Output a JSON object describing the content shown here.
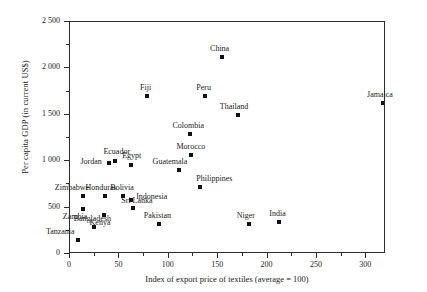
{
  "chart_data": {
    "type": "scatter",
    "title": "",
    "xlabel": "Index of export price of textiles (average = 100)",
    "ylabel": "Per capita GDP (in current US$)",
    "xlim": [
      0,
      320
    ],
    "ylim": [
      0,
      2500
    ],
    "grid": false,
    "legend": "none",
    "xticks": [
      0,
      50,
      100,
      150,
      200,
      250,
      300
    ],
    "xtick_labels": [
      "0",
      "50",
      "100",
      "150",
      "200",
      "250",
      "300"
    ],
    "xticks_minor": [
      25,
      75,
      125,
      175,
      225,
      275
    ],
    "yticks": [
      0,
      500,
      1000,
      1500,
      2000,
      2500
    ],
    "ytick_labels": [
      "0",
      "500",
      "1 000",
      "1 500",
      "2 000",
      "2 500"
    ],
    "yticks_minor": [
      250,
      750,
      1250,
      1750,
      2250
    ],
    "marker": "square",
    "marker_color": "#111111",
    "points": [
      {
        "name": "Tanzania",
        "x": 9,
        "y": 140,
        "lx": -32,
        "ly": -12
      },
      {
        "name": "Bangladesh",
        "x": 25,
        "y": 280,
        "lx": -20,
        "ly": -12
      },
      {
        "name": "Zambia",
        "x": 14,
        "y": 475,
        "lx": -20,
        "ly": 4
      },
      {
        "name": "Zimbabwe",
        "x": 14,
        "y": 615,
        "lx": -28,
        "ly": -12
      },
      {
        "name": "Kenya",
        "x": 35,
        "y": 410,
        "lx": -14,
        "ly": 4
      },
      {
        "name": "Honduras",
        "x": 36,
        "y": 615,
        "lx": -19,
        "ly": -12
      },
      {
        "name": "Bolivia",
        "x": 55,
        "y": 615,
        "lx": -13,
        "ly": -12
      },
      {
        "name": "Indonesia",
        "x": 63,
        "y": 570,
        "lx": 5,
        "ly": -7
      },
      {
        "name": "Sri Lanka",
        "x": 65,
        "y": 485,
        "lx": -12,
        "ly": -11
      },
      {
        "name": "Jordan",
        "x": 40,
        "y": 970,
        "lx": -28,
        "ly": -5
      },
      {
        "name": "Ecuador",
        "x": 47,
        "y": 990,
        "lx": -12,
        "ly": -13
      },
      {
        "name": "Egypt",
        "x": 63,
        "y": 950,
        "lx": -9,
        "ly": -13
      },
      {
        "name": "Pakistan",
        "x": 91,
        "y": 310,
        "lx": -15,
        "ly": -12
      },
      {
        "name": "Philippines",
        "x": 133,
        "y": 710,
        "lx": -4,
        "ly": -12
      },
      {
        "name": "Guatemala",
        "x": 111,
        "y": 895,
        "lx": -26,
        "ly": -12
      },
      {
        "name": "Morocco",
        "x": 124,
        "y": 1055,
        "lx": -15,
        "ly": -12
      },
      {
        "name": "Colombia",
        "x": 123,
        "y": 1280,
        "lx": -18,
        "ly": -12
      },
      {
        "name": "Thailand",
        "x": 171,
        "y": 1485,
        "lx": -18,
        "ly": -12
      },
      {
        "name": "Peru",
        "x": 138,
        "y": 1690,
        "lx": -9,
        "ly": -12
      },
      {
        "name": "Fiji",
        "x": 79,
        "y": 1690,
        "lx": -7,
        "ly": -12
      },
      {
        "name": "China",
        "x": 155,
        "y": 2110,
        "lx": -12,
        "ly": -12
      },
      {
        "name": "Jamaica",
        "x": 318,
        "y": 1615,
        "lx": -16,
        "ly": -12
      },
      {
        "name": "Niger",
        "x": 182,
        "y": 310,
        "lx": -12,
        "ly": -12
      },
      {
        "name": "India",
        "x": 213,
        "y": 330,
        "lx": -10,
        "ly": -12
      }
    ]
  }
}
